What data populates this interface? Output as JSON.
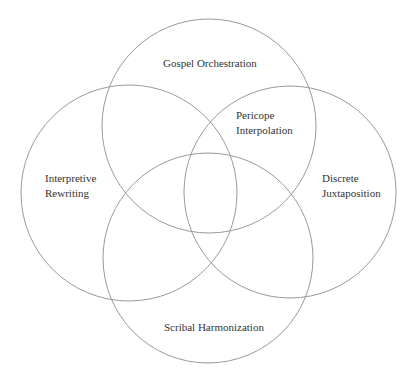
{
  "diagram": {
    "type": "venn",
    "stroke_color": "#9a9a9a",
    "text_color": "#333333",
    "circles": [
      {
        "id": "top",
        "cx": 209,
        "cy": 126,
        "r": 107
      },
      {
        "id": "left",
        "cx": 129,
        "cy": 193,
        "r": 108
      },
      {
        "id": "right",
        "cx": 290,
        "cy": 192,
        "r": 106
      },
      {
        "id": "bottom",
        "cx": 208,
        "cy": 258,
        "r": 105
      }
    ],
    "labels": {
      "top": {
        "lines": [
          "Gospel Orchestration"
        ]
      },
      "intersection": {
        "lines": [
          "Pericope",
          "Interpolation"
        ]
      },
      "left": {
        "lines": [
          "Interpretive",
          "Rewriting"
        ]
      },
      "right": {
        "lines": [
          "Discrete",
          "Juxtaposition"
        ]
      },
      "bottom": {
        "lines": [
          "Scribal Harmonization"
        ]
      }
    }
  }
}
